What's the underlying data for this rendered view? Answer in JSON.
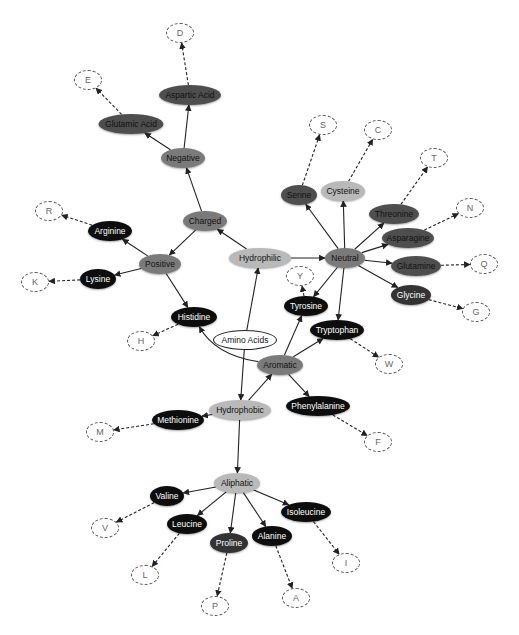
{
  "colors": {
    "root": "#ffffff",
    "light": "#b9b9b9",
    "mid": "#7a7a7a",
    "dark": "#4e4e4e",
    "darker": "#333333",
    "black": "#0d0d0d",
    "edge": "#222222"
  },
  "nodes": [
    {
      "id": "amino",
      "label": "Amino Acids",
      "x": 245,
      "y": 340,
      "w": 64,
      "h": 20,
      "style": "root"
    },
    {
      "id": "hydrophilic",
      "label": "Hydrophilic",
      "x": 260,
      "y": 258,
      "w": 62,
      "h": 20,
      "style": "light"
    },
    {
      "id": "hydrophobic",
      "label": "Hydrophobic",
      "x": 240,
      "y": 410,
      "w": 62,
      "h": 20,
      "style": "light"
    },
    {
      "id": "charged",
      "label": "Charged",
      "x": 205,
      "y": 221,
      "w": 44,
      "h": 20,
      "style": "mid"
    },
    {
      "id": "neutral",
      "label": "Neutral",
      "x": 345,
      "y": 258,
      "w": 40,
      "h": 20,
      "style": "mid"
    },
    {
      "id": "aromatic",
      "label": "Aromatic",
      "x": 280,
      "y": 365,
      "w": 46,
      "h": 20,
      "style": "mid"
    },
    {
      "id": "aliphatic",
      "label": "Aliphatic",
      "x": 237,
      "y": 483,
      "w": 46,
      "h": 20,
      "style": "light"
    },
    {
      "id": "negative",
      "label": "Negative",
      "x": 183,
      "y": 158,
      "w": 44,
      "h": 20,
      "style": "mid"
    },
    {
      "id": "positive",
      "label": "Positive",
      "x": 160,
      "y": 264,
      "w": 42,
      "h": 20,
      "style": "mid"
    },
    {
      "id": "aspartic",
      "label": "Aspartic Acid",
      "x": 190,
      "y": 95,
      "w": 62,
      "h": 20,
      "style": "dark"
    },
    {
      "id": "glutamic",
      "label": "Glutamic Acid",
      "x": 131,
      "y": 124,
      "w": 65,
      "h": 20,
      "style": "dark"
    },
    {
      "id": "arginine",
      "label": "Arginine",
      "x": 110,
      "y": 231,
      "w": 44,
      "h": 20,
      "style": "black"
    },
    {
      "id": "lysine",
      "label": "Lysine",
      "x": 98,
      "y": 279,
      "w": 36,
      "h": 20,
      "style": "black"
    },
    {
      "id": "histidine",
      "label": "Histidine",
      "x": 194,
      "y": 317,
      "w": 46,
      "h": 20,
      "style": "black"
    },
    {
      "id": "serine",
      "label": "Serine",
      "x": 299,
      "y": 195,
      "w": 36,
      "h": 20,
      "style": "dark"
    },
    {
      "id": "cysteine",
      "label": "Cysteine",
      "x": 343,
      "y": 191,
      "w": 44,
      "h": 20,
      "style": "light"
    },
    {
      "id": "threonine",
      "label": "Threonine",
      "x": 394,
      "y": 214,
      "w": 50,
      "h": 20,
      "style": "dark"
    },
    {
      "id": "asparagine",
      "label": "Asparagine",
      "x": 408,
      "y": 238,
      "w": 52,
      "h": 20,
      "style": "dark"
    },
    {
      "id": "glutamine",
      "label": "Glutamine",
      "x": 416,
      "y": 266,
      "w": 50,
      "h": 20,
      "style": "dark"
    },
    {
      "id": "glycine",
      "label": "Glycine",
      "x": 411,
      "y": 295,
      "w": 40,
      "h": 20,
      "style": "darker"
    },
    {
      "id": "tyrosine",
      "label": "Tyrosine",
      "x": 306,
      "y": 306,
      "w": 44,
      "h": 20,
      "style": "black"
    },
    {
      "id": "tryptophan",
      "label": "Tryptophan",
      "x": 337,
      "y": 330,
      "w": 54,
      "h": 20,
      "style": "black"
    },
    {
      "id": "phenylalanine",
      "label": "Phenylalanine",
      "x": 318,
      "y": 406,
      "w": 64,
      "h": 20,
      "style": "black"
    },
    {
      "id": "methionine",
      "label": "Methionine",
      "x": 178,
      "y": 420,
      "w": 52,
      "h": 20,
      "style": "black"
    },
    {
      "id": "valine",
      "label": "Valine",
      "x": 167,
      "y": 496,
      "w": 34,
      "h": 20,
      "style": "black"
    },
    {
      "id": "leucine",
      "label": "Leucine",
      "x": 187,
      "y": 524,
      "w": 40,
      "h": 20,
      "style": "black"
    },
    {
      "id": "proline",
      "label": "Proline",
      "x": 229,
      "y": 543,
      "w": 38,
      "h": 20,
      "style": "darker"
    },
    {
      "id": "alanine",
      "label": "Alanine",
      "x": 272,
      "y": 536,
      "w": 40,
      "h": 20,
      "style": "black"
    },
    {
      "id": "isoleucine",
      "label": "Isoleucine",
      "x": 306,
      "y": 512,
      "w": 50,
      "h": 20,
      "style": "black"
    },
    {
      "id": "D",
      "label": "D",
      "x": 180,
      "y": 33,
      "w": 28,
      "h": 20,
      "style": "code"
    },
    {
      "id": "E",
      "label": "E",
      "x": 88,
      "y": 80,
      "w": 28,
      "h": 20,
      "style": "code"
    },
    {
      "id": "R",
      "label": "R",
      "x": 49,
      "y": 211,
      "w": 28,
      "h": 20,
      "style": "code"
    },
    {
      "id": "K",
      "label": "K",
      "x": 35,
      "y": 282,
      "w": 28,
      "h": 20,
      "style": "code"
    },
    {
      "id": "H",
      "label": "H",
      "x": 141,
      "y": 341,
      "w": 28,
      "h": 20,
      "style": "code"
    },
    {
      "id": "S",
      "label": "S",
      "x": 323,
      "y": 125,
      "w": 28,
      "h": 20,
      "style": "code"
    },
    {
      "id": "C",
      "label": "C",
      "x": 378,
      "y": 130,
      "w": 28,
      "h": 20,
      "style": "code"
    },
    {
      "id": "T",
      "label": "T",
      "x": 434,
      "y": 158,
      "w": 28,
      "h": 20,
      "style": "code"
    },
    {
      "id": "N",
      "label": "N",
      "x": 470,
      "y": 208,
      "w": 28,
      "h": 20,
      "style": "code"
    },
    {
      "id": "Q",
      "label": "Q",
      "x": 484,
      "y": 264,
      "w": 28,
      "h": 20,
      "style": "code"
    },
    {
      "id": "G",
      "label": "G",
      "x": 476,
      "y": 312,
      "w": 28,
      "h": 20,
      "style": "code"
    },
    {
      "id": "Y",
      "label": "Y",
      "x": 300,
      "y": 276,
      "w": 28,
      "h": 20,
      "style": "code"
    },
    {
      "id": "W",
      "label": "W",
      "x": 389,
      "y": 364,
      "w": 28,
      "h": 20,
      "style": "code"
    },
    {
      "id": "F",
      "label": "F",
      "x": 378,
      "y": 442,
      "w": 28,
      "h": 20,
      "style": "code"
    },
    {
      "id": "M",
      "label": "M",
      "x": 100,
      "y": 432,
      "w": 28,
      "h": 20,
      "style": "code"
    },
    {
      "id": "V",
      "label": "V",
      "x": 105,
      "y": 528,
      "w": 28,
      "h": 20,
      "style": "code"
    },
    {
      "id": "L",
      "label": "L",
      "x": 145,
      "y": 575,
      "w": 28,
      "h": 20,
      "style": "code"
    },
    {
      "id": "P",
      "label": "P",
      "x": 215,
      "y": 606,
      "w": 28,
      "h": 20,
      "style": "code"
    },
    {
      "id": "A",
      "label": "A",
      "x": 296,
      "y": 598,
      "w": 28,
      "h": 20,
      "style": "code"
    },
    {
      "id": "I",
      "label": "I",
      "x": 346,
      "y": 563,
      "w": 28,
      "h": 20,
      "style": "code"
    }
  ],
  "edges": [
    {
      "from": "amino",
      "to": "hydrophilic",
      "dashed": false
    },
    {
      "from": "amino",
      "to": "hydrophobic",
      "dashed": false
    },
    {
      "from": "hydrophilic",
      "to": "charged",
      "dashed": false
    },
    {
      "from": "hydrophilic",
      "to": "neutral",
      "dashed": false
    },
    {
      "from": "charged",
      "to": "negative",
      "dashed": false
    },
    {
      "from": "charged",
      "to": "positive",
      "dashed": false
    },
    {
      "from": "negative",
      "to": "aspartic",
      "dashed": false
    },
    {
      "from": "negative",
      "to": "glutamic",
      "dashed": false
    },
    {
      "from": "positive",
      "to": "arginine",
      "dashed": false
    },
    {
      "from": "positive",
      "to": "lysine",
      "dashed": false
    },
    {
      "from": "positive",
      "to": "histidine",
      "dashed": false
    },
    {
      "from": "aromatic",
      "to": "histidine",
      "dashed": false,
      "curved": true
    },
    {
      "from": "neutral",
      "to": "serine",
      "dashed": false
    },
    {
      "from": "neutral",
      "to": "cysteine",
      "dashed": false
    },
    {
      "from": "neutral",
      "to": "threonine",
      "dashed": false
    },
    {
      "from": "neutral",
      "to": "asparagine",
      "dashed": false
    },
    {
      "from": "neutral",
      "to": "glutamine",
      "dashed": false
    },
    {
      "from": "neutral",
      "to": "glycine",
      "dashed": false
    },
    {
      "from": "neutral",
      "to": "tyrosine",
      "dashed": false
    },
    {
      "from": "neutral",
      "to": "tryptophan",
      "dashed": false
    },
    {
      "from": "hydrophobic",
      "to": "aromatic",
      "dashed": false
    },
    {
      "from": "hydrophobic",
      "to": "methionine",
      "dashed": false
    },
    {
      "from": "hydrophobic",
      "to": "aliphatic",
      "dashed": false
    },
    {
      "from": "aromatic",
      "to": "tyrosine",
      "dashed": false
    },
    {
      "from": "aromatic",
      "to": "tryptophan",
      "dashed": false
    },
    {
      "from": "aromatic",
      "to": "phenylalanine",
      "dashed": false
    },
    {
      "from": "aliphatic",
      "to": "valine",
      "dashed": false
    },
    {
      "from": "aliphatic",
      "to": "leucine",
      "dashed": false
    },
    {
      "from": "aliphatic",
      "to": "proline",
      "dashed": false
    },
    {
      "from": "aliphatic",
      "to": "alanine",
      "dashed": false
    },
    {
      "from": "aliphatic",
      "to": "isoleucine",
      "dashed": false
    },
    {
      "from": "aspartic",
      "to": "D",
      "dashed": true
    },
    {
      "from": "glutamic",
      "to": "E",
      "dashed": true
    },
    {
      "from": "arginine",
      "to": "R",
      "dashed": true
    },
    {
      "from": "lysine",
      "to": "K",
      "dashed": true
    },
    {
      "from": "histidine",
      "to": "H",
      "dashed": true
    },
    {
      "from": "serine",
      "to": "S",
      "dashed": true
    },
    {
      "from": "cysteine",
      "to": "C",
      "dashed": true
    },
    {
      "from": "threonine",
      "to": "T",
      "dashed": true
    },
    {
      "from": "asparagine",
      "to": "N",
      "dashed": true
    },
    {
      "from": "glutamine",
      "to": "Q",
      "dashed": true
    },
    {
      "from": "glycine",
      "to": "G",
      "dashed": true
    },
    {
      "from": "tyrosine",
      "to": "Y",
      "dashed": true
    },
    {
      "from": "tryptophan",
      "to": "W",
      "dashed": true
    },
    {
      "from": "phenylalanine",
      "to": "F",
      "dashed": true
    },
    {
      "from": "methionine",
      "to": "M",
      "dashed": true
    },
    {
      "from": "valine",
      "to": "V",
      "dashed": true
    },
    {
      "from": "leucine",
      "to": "L",
      "dashed": true
    },
    {
      "from": "proline",
      "to": "P",
      "dashed": true
    },
    {
      "from": "alanine",
      "to": "A",
      "dashed": true
    },
    {
      "from": "isoleucine",
      "to": "I",
      "dashed": true
    }
  ]
}
